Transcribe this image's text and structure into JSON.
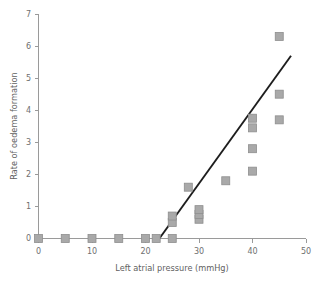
{
  "chart_data": {
    "type": "scatter",
    "title": "",
    "xlabel": "Left atrial pressure (mmHg)",
    "ylabel": "Rate of oedema formation",
    "xlim": [
      0,
      50
    ],
    "ylim": [
      0,
      7
    ],
    "xticks": [
      0,
      10,
      20,
      30,
      40,
      50
    ],
    "xtick_labels": [
      "0",
      "10",
      "20",
      "30",
      "40",
      "50"
    ],
    "xminor_ticks": [
      5,
      15,
      25,
      35,
      45
    ],
    "yticks": [
      0,
      1,
      2,
      3,
      4,
      5,
      6,
      7
    ],
    "ytick_labels": [
      "0",
      "1",
      "2",
      "3",
      "4",
      "5",
      "6",
      "7"
    ],
    "grid": false,
    "legend": null,
    "marker_style": "square",
    "marker_color": "#a9a9a9",
    "marker_edge_color": "#8e8e8e",
    "line_color": "#1d1d1d",
    "points": [
      {
        "x": 0,
        "y": 0.0
      },
      {
        "x": 5,
        "y": 0.0
      },
      {
        "x": 10,
        "y": 0.0
      },
      {
        "x": 15,
        "y": 0.0
      },
      {
        "x": 20,
        "y": 0.0
      },
      {
        "x": 22,
        "y": 0.0
      },
      {
        "x": 25,
        "y": 0.0
      },
      {
        "x": 25,
        "y": 0.5
      },
      {
        "x": 25,
        "y": 0.7
      },
      {
        "x": 28,
        "y": 1.6
      },
      {
        "x": 30,
        "y": 0.6
      },
      {
        "x": 30,
        "y": 0.75
      },
      {
        "x": 30,
        "y": 0.9
      },
      {
        "x": 35,
        "y": 1.8
      },
      {
        "x": 40,
        "y": 2.1
      },
      {
        "x": 40,
        "y": 2.8
      },
      {
        "x": 40,
        "y": 3.45
      },
      {
        "x": 40,
        "y": 3.75
      },
      {
        "x": 45,
        "y": 3.7
      },
      {
        "x": 45,
        "y": 4.5
      },
      {
        "x": 45,
        "y": 6.3
      }
    ],
    "fit_line": {
      "label": "regression line",
      "x_start": 22.6,
      "y_start": 0.0,
      "x_end": 47.2,
      "y_end": 5.7
    }
  }
}
